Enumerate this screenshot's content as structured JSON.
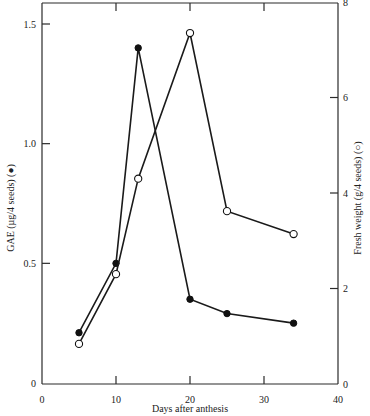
{
  "chart_data": {
    "type": "line",
    "title": "",
    "xlabel": "Days after anthesis",
    "ylabel": "GAE (µg/4 seeds) (●)",
    "ylabel_right": "Fresh weight (g/4 seeds) (○)",
    "xlim": [
      0,
      40
    ],
    "ylim": [
      0,
      1.6
    ],
    "ylim_right": [
      0,
      8
    ],
    "x_ticks": [
      0,
      10,
      20,
      30,
      40
    ],
    "x_tick_labels": [
      "0",
      "10",
      "20",
      "30",
      "40"
    ],
    "y_ticks": [
      0,
      0.5,
      1.0,
      1.5
    ],
    "y_tick_labels": [
      "0",
      "0.5",
      "1.0",
      "1.5"
    ],
    "y_ticks_right": [
      0,
      2,
      4,
      6,
      8
    ],
    "y_tick_labels_right": [
      "0",
      "2",
      "4",
      "6",
      "8"
    ],
    "grid": false,
    "legend": "none (markers identified in axis titles)",
    "series": [
      {
        "name": "GAE",
        "axis": "left",
        "marker": "filled-circle",
        "x": [
          5,
          10,
          13,
          20,
          25,
          34
        ],
        "values": [
          0.21,
          0.5,
          1.4,
          0.35,
          0.29,
          0.25
        ]
      },
      {
        "name": "Fresh weight",
        "axis": "right",
        "marker": "open-circle",
        "x": [
          5,
          10,
          13,
          20,
          25,
          34
        ],
        "values": [
          0.84,
          2.3,
          4.3,
          7.35,
          3.62,
          3.14
        ]
      }
    ]
  },
  "colors": {
    "axis": "#2a2a2a",
    "line": "#1a1a1a",
    "background": "#ffffff"
  }
}
